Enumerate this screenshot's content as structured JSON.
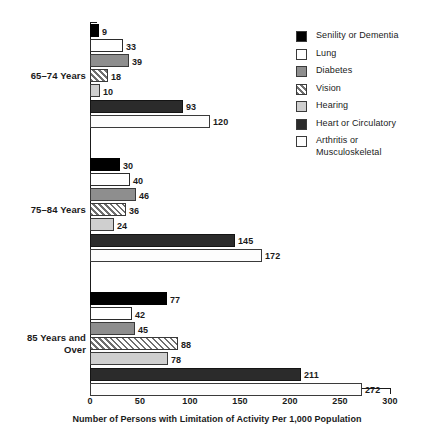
{
  "chart_data": {
    "type": "bar",
    "orientation": "horizontal",
    "title": "",
    "xlabel": "Number of Persons with Limitation of Activity Per 1,000 Population",
    "ylabel": "",
    "xlim": [
      0,
      300
    ],
    "xticks": [
      0,
      50,
      100,
      150,
      200,
      250,
      300
    ],
    "xtick_labels": [
      "0",
      "50",
      "100",
      "150",
      "200",
      "250",
      "300"
    ],
    "grid": false,
    "legend_position": "right",
    "categories": [
      "65–74 Years",
      "75–84 Years",
      "85 Years and\nOver"
    ],
    "series": [
      {
        "name": "Senility or Dementia",
        "color": "#000000",
        "pattern": "solid",
        "values": [
          9,
          30,
          77
        ]
      },
      {
        "name": "Lung",
        "color": "#ffffff",
        "pattern": "solid",
        "values": [
          33,
          40,
          42
        ]
      },
      {
        "name": "Diabetes",
        "color": "#8e8e8e",
        "pattern": "solid",
        "values": [
          39,
          46,
          45
        ]
      },
      {
        "name": "Vision",
        "color": "#ffffff",
        "pattern": "diagonal-hatch",
        "values": [
          18,
          36,
          88
        ]
      },
      {
        "name": "Hearing",
        "color": "#cfcfcf",
        "pattern": "solid",
        "values": [
          10,
          24,
          78
        ]
      },
      {
        "name": "Heart or Circulatory",
        "color": "#2b2b2b",
        "pattern": "solid",
        "values": [
          93,
          145,
          211
        ]
      },
      {
        "name": "Arthritis or\nMusculoskeletal",
        "color": "#fdfdfd",
        "pattern": "dotted",
        "values": [
          120,
          172,
          272
        ]
      }
    ]
  },
  "legend": {
    "items": [
      {
        "label": "Senility or Dementia",
        "swatch": "senility"
      },
      {
        "label": "Lung",
        "swatch": "lung"
      },
      {
        "label": "Diabetes",
        "swatch": "diabetes"
      },
      {
        "label": "Vision",
        "swatch": "vision"
      },
      {
        "label": "Hearing",
        "swatch": "hearing"
      },
      {
        "label": "Heart or Circulatory",
        "swatch": "heart"
      },
      {
        "label": "Arthritis or\nMusculoskeletal",
        "swatch": "arthritis"
      }
    ]
  },
  "axis": {
    "x_title": "Number of Persons with Limitation of Activity Per 1,000 Population",
    "ticks": [
      "0",
      "50",
      "100",
      "150",
      "200",
      "250",
      "300"
    ]
  },
  "groups": [
    {
      "label": "65–74 Years"
    },
    {
      "label": "75–84 Years"
    },
    {
      "label": "85 Years and\nOver"
    }
  ]
}
